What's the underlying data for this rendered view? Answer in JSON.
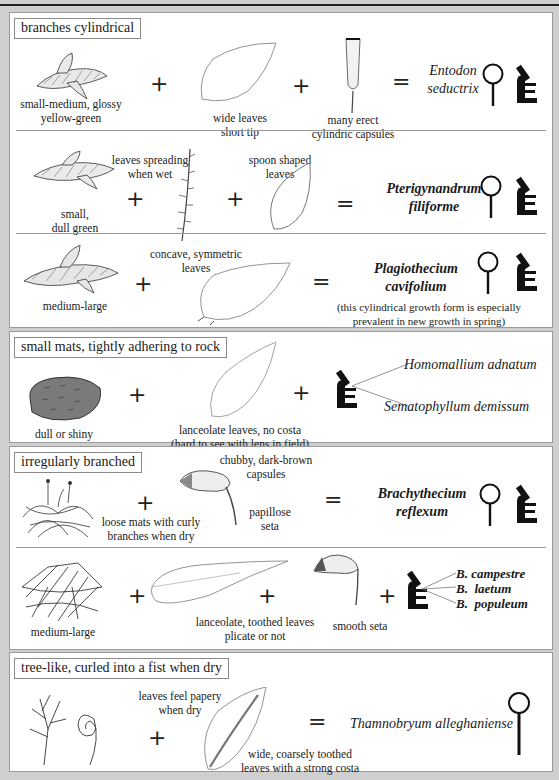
{
  "sections": [
    {
      "title": "branches cylindrical",
      "rows": [
        {
          "plant_caption": [
            "small-medium, glossy",
            "yellow-green"
          ],
          "feature1_caption": [
            "wide leaves",
            "short tip"
          ],
          "feature2_caption": [
            "many erect",
            "cylindric capsules"
          ],
          "species": [
            "Entodon",
            "seductrix"
          ],
          "tools": [
            "hand-lens",
            "microscope"
          ]
        },
        {
          "plant_caption": [
            "small,",
            "dull green"
          ],
          "feature1_caption": [
            "leaves spreading",
            "when wet"
          ],
          "feature2_caption": [
            "spoon shaped",
            "leaves"
          ],
          "species": [
            "Pterigynandrum",
            "filiforme"
          ],
          "tools": [
            "hand-lens",
            "microscope"
          ]
        },
        {
          "plant_caption": [
            "medium-large"
          ],
          "feature1_caption": [
            "concave, symmetric",
            "leaves"
          ],
          "species": [
            "Plagiothecium",
            "cavifolium"
          ],
          "note": [
            "(this cylindrical growth form is especially",
            "prevalent in new growth in spring)"
          ],
          "tools": [
            "hand-lens",
            "microscope"
          ]
        }
      ]
    },
    {
      "title": "small mats, tightly adhering to rock",
      "rows": [
        {
          "plant_caption": [
            "dull or shiny"
          ],
          "feature1_caption": [
            "lanceolate leaves, no costa",
            "(hard to see with lens in field)"
          ],
          "species_list": [
            "Homomallium adnatum",
            "Sematophyllum demissum"
          ],
          "tools": [
            "microscope"
          ]
        }
      ]
    },
    {
      "title": "irregularly branched",
      "rows": [
        {
          "plant_caption": [
            "loose mats with curly",
            "branches when dry"
          ],
          "feature1_caption": [
            "chubby, dark-brown",
            "capsules"
          ],
          "feature2_caption": [
            "papillose",
            "seta"
          ],
          "species": [
            "Brachythecium",
            "reflexum"
          ],
          "tools": [
            "hand-lens",
            "microscope"
          ]
        },
        {
          "plant_caption": [
            "medium-large"
          ],
          "feature1_caption": [
            "lanceolate, toothed leaves",
            "plicate or not"
          ],
          "feature2_caption": [
            "smooth seta"
          ],
          "species_list": [
            "B. campestre",
            "B.  laetum",
            "B.  populeum"
          ],
          "tools": [
            "microscope"
          ]
        }
      ]
    },
    {
      "title": "tree-like, curled into a fist when dry",
      "rows": [
        {
          "feature1_caption": [
            "leaves feel papery",
            "when dry"
          ],
          "feature2_caption": [
            "wide, coarsely toothed",
            "leaves with a strong costa"
          ],
          "species": [
            "Thamnobryum alleghaniense"
          ],
          "tools": [
            "hand-lens"
          ]
        }
      ]
    }
  ],
  "symbols": {
    "plus": "+",
    "equals": "="
  },
  "colors": {
    "background": "#cfcfcf",
    "panel": "#ffffff",
    "ink": "#1a1a1a",
    "mat_fill": "#7a7a7a"
  }
}
